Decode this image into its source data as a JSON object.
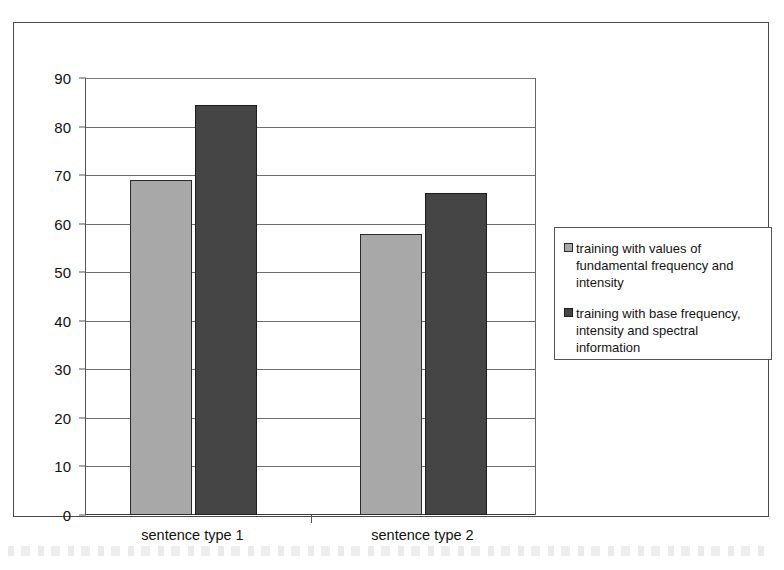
{
  "chart_data": {
    "type": "bar",
    "title": "",
    "subtitle": "",
    "xlabel": "",
    "ylabel": "",
    "categories": [
      "sentence type 1",
      "sentence type 2"
    ],
    "series": [
      {
        "name": "training with values of fundamental frequency and intensity",
        "color": "#a8a8a8",
        "values": [
          69,
          57.8
        ]
      },
      {
        "name": "training with base frequency, intensity and spectral information",
        "color": "#454545",
        "values": [
          84.5,
          66.3
        ]
      }
    ],
    "ylim": [
      0,
      90
    ],
    "ytick_values": [
      0,
      10,
      20,
      30,
      40,
      50,
      60,
      70,
      80,
      90
    ],
    "ytick_labels": [
      "0",
      "10",
      "20",
      "30",
      "40",
      "50",
      "60",
      "70",
      "80",
      "90"
    ],
    "grid": true,
    "grid_axis": "y",
    "legend_position": "right",
    "legend_entries": [
      "training with values of fundamental frequency and intensity",
      "training with base frequency, intensity and spectral information"
    ]
  },
  "figure": {
    "frame_color": "#4a4a4a",
    "background": "#ffffff",
    "axis_color": "#555555",
    "gridline_color": "#6e6e6e"
  }
}
